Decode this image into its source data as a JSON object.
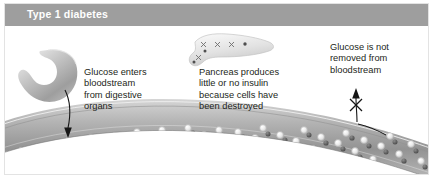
{
  "figure": {
    "width": 433,
    "height": 178
  },
  "header": {
    "title": "Type 1 diabetes",
    "bar_color": "#9e9e9e",
    "text_color": "#ffffff"
  },
  "callouts": [
    {
      "id": "stomach",
      "text": "Glucose enters\nbloodstream\nfrom digestive\norgans"
    },
    {
      "id": "pancreas",
      "text": "Pancreas produces\nlittle or no insulin\nbecause cells have\nbeen destroyed"
    },
    {
      "id": "kidney",
      "text": "Glucose is not\nremoved from\nbloodstream"
    }
  ],
  "illustrations": {
    "stomach": {
      "label": "stomach",
      "fill": "#bdbdbd"
    },
    "pancreas": {
      "label": "pancreas",
      "fill": "#dcdcdc",
      "destroyed_cell_marks": 4,
      "cell_dots": 3,
      "mark_glyph": "x"
    },
    "bloodstream": {
      "label": "blood vessel",
      "fill_light": "#c9c9c9",
      "fill_dark": "#8a8a8a",
      "outline": "#7a7a7a"
    },
    "arrows": {
      "glucose_in": {
        "label": "glucose-enters-arrow",
        "direction": "down",
        "color": "#1a1a1a"
      },
      "glucose_out_blocked": {
        "label": "glucose-removal-blocked-arrow",
        "direction": "up",
        "blocked": true,
        "block_glyph": "x",
        "color": "#1a1a1a"
      }
    },
    "particles": {
      "glucose_label": "glucose-molecule",
      "glucose_ring_color": "#f2f2f2",
      "glucose_core_color": "#a9a9a9",
      "dark_label": "cell-particle",
      "dark_color": "#5a5a5a",
      "glucose_count": 44,
      "dark_count": 37
    }
  },
  "colors": {
    "background": "#ffffff",
    "border": "#e3e3e3",
    "text": "#231f20"
  }
}
